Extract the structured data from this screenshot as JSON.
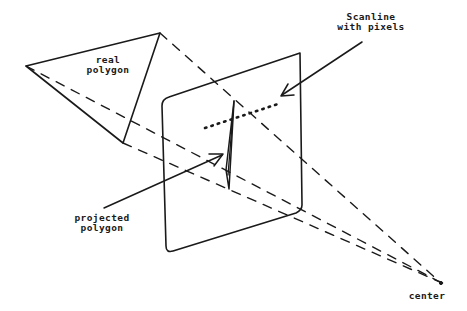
{
  "diagram": {
    "type": "perspective projection illustration",
    "labels": {
      "real_polygon": [
        "real",
        "polygon"
      ],
      "scanline": [
        "Scanline",
        "with pixels"
      ],
      "projected_polygon": [
        "projected",
        "polygon"
      ],
      "center": "center"
    },
    "colors": {
      "stroke": "#1a1a1a",
      "background": "#ffffff"
    },
    "elements": {
      "real_polygon_vertices": [
        [
          26,
          66
        ],
        [
          160,
          33
        ],
        [
          123,
          143
        ]
      ],
      "projection_plane_corners": [
        [
          162,
          98
        ],
        [
          300,
          53
        ],
        [
          302,
          212
        ],
        [
          166,
          252
        ]
      ],
      "center_point": [
        440,
        282
      ],
      "scanline_start": [
        205,
        128
      ],
      "scanline_end": [
        278,
        104
      ],
      "projected_polygon_top": [
        234,
        101
      ],
      "projected_polygon_bottom": [
        229,
        189
      ]
    }
  }
}
